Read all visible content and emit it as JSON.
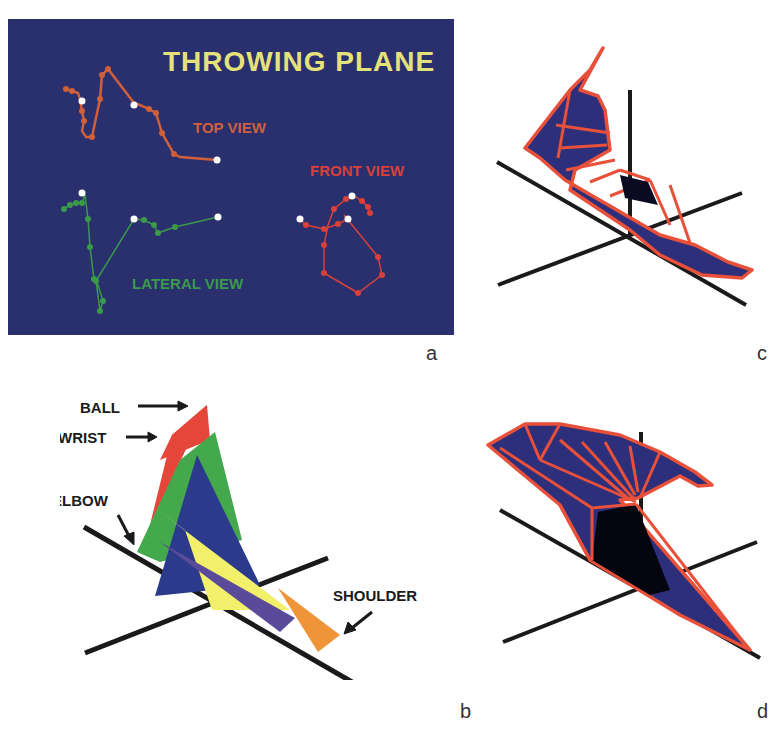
{
  "panel_a": {
    "letter": "a",
    "title": "THROWING PLANE",
    "labels": {
      "top": "TOP VIEW",
      "front": "FRONT VIEW",
      "lateral": "LATERAL VIEW"
    },
    "colors": {
      "background": "#2a2f6e",
      "title": "#e6e27a",
      "top": "#d0603a",
      "front": "#d8403a",
      "lateral": "#3a9a4a",
      "marker": "#ffffff"
    }
  },
  "panel_b": {
    "letter": "b",
    "labels": {
      "ball": "BALL",
      "wrist": "WRIST",
      "elbow": "ELBOW",
      "shoulder": "SHOULDER"
    },
    "colors": {
      "ball": "#e4473a",
      "wrist": "#44a84c",
      "elbow": "#2b3a8a",
      "yellow": "#f2f06a",
      "purple": "#5a4a9a",
      "shoulder": "#f0943a",
      "axes": "#1a1a1a"
    }
  },
  "panel_c": {
    "letter": "c",
    "colors": {
      "fill": "#2d2f7a",
      "edge": "#e8503a",
      "axes": "#1a1a1a"
    }
  },
  "panel_d": {
    "letter": "d",
    "colors": {
      "fill": "#2d2f7a",
      "edge": "#e8503a",
      "axes": "#1a1a1a"
    }
  }
}
